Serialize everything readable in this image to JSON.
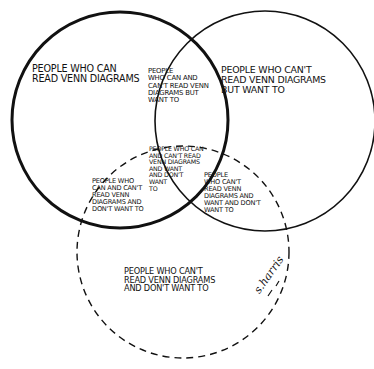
{
  "diagram": {
    "type": "venn",
    "style": "hand-drawn cartoon",
    "stroke_color": "#111111",
    "background": "#ffffff",
    "circles": [
      {
        "id": "A",
        "label": "People who can read Venn diagrams",
        "stroke": "solid-bold",
        "cx": 120,
        "cy": 120,
        "r": 108
      },
      {
        "id": "B",
        "label": "People who can't read Venn diagrams but want to",
        "stroke": "solid",
        "cx": 265,
        "cy": 120,
        "r": 110
      },
      {
        "id": "C",
        "label": "People who can't read Venn diagrams and don't want to",
        "stroke": "dashed",
        "cx": 183,
        "cy": 252,
        "r": 106
      }
    ],
    "regions": {
      "a_only": "People who can\nread Venn diagrams",
      "a_and_b": "People\nwho can and\ncan't read Venn\ndiagrams but\nwant to",
      "b_only": "People who can't\nread Venn diagrams\nbut want to",
      "a_b_c": "People who can\nand can't read\nVenn diagrams\nand want\nand don't\nwant\nto",
      "a_and_c": "People who\ncan and can't\nread Venn\ndiagrams and\ndon't want to",
      "b_and_c": "People\nwho can't\nread Venn\ndiagrams and\nwant and don't\nwant to",
      "c_only": "People who can't\nread Venn diagrams\nand don't want to"
    },
    "signature": "s.harris"
  }
}
